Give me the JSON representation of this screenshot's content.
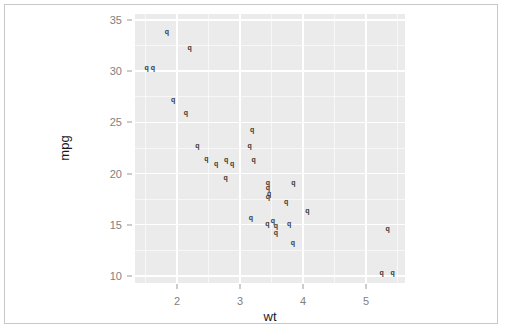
{
  "figure": {
    "panel_background": "#ebebeb",
    "gridline_color": "#ffffff",
    "point_color": "#3a3a3a",
    "axis_text_color": "#7f7f7f",
    "axis_title_color": "#1a1a1a",
    "frame_border_color": "#c9c9c9"
  },
  "chart_data": {
    "type": "scatter",
    "title": "",
    "xlabel": "wt",
    "ylabel": "mpg",
    "xlim": [
      1.33,
      5.62
    ],
    "ylim": [
      9.3,
      35.6
    ],
    "x_ticks": [
      2,
      3,
      4,
      5
    ],
    "x_tick_labels": [
      "2",
      "3",
      "4",
      "5"
    ],
    "y_ticks": [
      10,
      15,
      20,
      25,
      30,
      35
    ],
    "y_tick_labels": [
      "10",
      "15",
      "20",
      "25",
      "30",
      "35"
    ],
    "x_minor_ticks": [
      1.5,
      2.5,
      3.5,
      4.5,
      5.5
    ],
    "y_minor_ticks": [
      12.5,
      17.5,
      22.5,
      27.5,
      32.5
    ],
    "grid": true,
    "legend": false,
    "legend_position": "none",
    "marker_glyph": "q",
    "marker_shape_name": "letter-q",
    "series": [
      {
        "name": "mtcars",
        "x": [
          2.62,
          2.875,
          2.32,
          3.215,
          3.44,
          3.46,
          3.57,
          3.19,
          3.15,
          3.44,
          3.44,
          4.07,
          3.73,
          3.78,
          5.25,
          5.424,
          5.345,
          2.2,
          1.615,
          1.835,
          2.465,
          3.52,
          3.435,
          3.84,
          3.845,
          1.935,
          2.14,
          1.513,
          3.17,
          2.77,
          3.57,
          2.78
        ],
        "y": [
          21.0,
          21.0,
          22.8,
          21.4,
          18.7,
          18.1,
          14.3,
          24.4,
          22.8,
          19.2,
          17.8,
          16.4,
          17.3,
          15.2,
          10.4,
          10.4,
          14.7,
          32.4,
          30.4,
          33.9,
          21.5,
          15.5,
          15.2,
          13.3,
          19.2,
          27.3,
          26.0,
          30.4,
          15.8,
          19.7,
          15.0,
          21.4
        ]
      }
    ]
  }
}
